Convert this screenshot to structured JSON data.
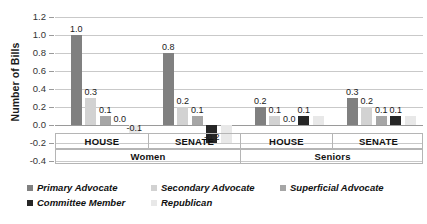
{
  "chart_data": {
    "type": "bar",
    "title": "",
    "xlabel": "",
    "ylabel": "Number of Bills",
    "ylim": [
      -0.4,
      1.2
    ],
    "ytick_step": 0.2,
    "grid": true,
    "legend_position": "bottom",
    "ytick_labels": [
      "1.2",
      "1.0",
      "0.8",
      "0.6",
      "0.4",
      "0.2",
      "0.0",
      "-0.2",
      "-0.4"
    ],
    "ytick_values": [
      1.2,
      1.0,
      0.8,
      0.6,
      0.4,
      0.2,
      0.0,
      -0.2,
      -0.4
    ],
    "group_labels": [
      "Women",
      "Seniors"
    ],
    "categories": [
      "HOUSE",
      "SENATE",
      "HOUSE",
      "SENATE"
    ],
    "series": [
      {
        "name": "Primary Advocate",
        "color": "#808080",
        "values": [
          1.0,
          0.8,
          0.2,
          0.3
        ]
      },
      {
        "name": "Secondary Advocate",
        "color": "#d2d2d2",
        "values": [
          0.3,
          0.2,
          0.1,
          0.2
        ]
      },
      {
        "name": "Superficial Advocate",
        "color": "#a6a6a6",
        "values": [
          0.1,
          0.1,
          0.0,
          0.1
        ]
      },
      {
        "name": "Committee Member",
        "color": "#262626",
        "values": [
          0.0,
          -0.2,
          0.1,
          0.1
        ]
      },
      {
        "name": "Republican",
        "color": "#e8e8e8",
        "values": [
          -0.1,
          -0.2,
          0.1,
          0.1
        ]
      }
    ],
    "bar_labels": [
      [
        "1.0",
        "0.3",
        "0.1",
        "0.0",
        "-0.1"
      ],
      [
        "0.8",
        "0.2",
        "0.1",
        "-0.2",
        ""
      ],
      [
        "0.2",
        "0.1",
        "0.0",
        "0.1",
        ""
      ],
      [
        "0.3",
        "0.2",
        "0.1",
        "0.1",
        ""
      ]
    ]
  },
  "legend": {
    "items": [
      {
        "label": "Primary Advocate",
        "color": "#808080"
      },
      {
        "label": "Secondary Advocate",
        "color": "#d2d2d2"
      },
      {
        "label": "Superficial Advocate",
        "color": "#a6a6a6"
      },
      {
        "label": "Committee Member",
        "color": "#262626"
      },
      {
        "label": "Republican",
        "color": "#e8e8e8"
      }
    ]
  }
}
